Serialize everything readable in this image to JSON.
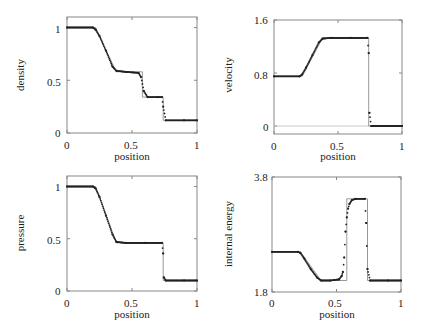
{
  "chart_data": [
    {
      "type": "line",
      "title": "",
      "xlabel": "position",
      "ylabel": "density",
      "xlim": [
        0,
        1
      ],
      "ylim": [
        0,
        1.1
      ],
      "xticks": [
        "0",
        "0.5",
        "1"
      ],
      "yticks": [
        "0",
        "0.5",
        "1"
      ],
      "grid": false,
      "series": [
        {
          "name": "exact",
          "style": "thin gray line",
          "x": [
            0,
            0.22,
            0.3,
            0.38,
            0.58,
            0.58,
            0.74,
            0.74,
            1.0
          ],
          "y": [
            1.0,
            1.0,
            0.78,
            0.58,
            0.58,
            0.34,
            0.34,
            0.12,
            0.12
          ]
        },
        {
          "name": "numerical",
          "style": "dots",
          "x": [
            0,
            0.2,
            0.22,
            0.25,
            0.3,
            0.35,
            0.38,
            0.45,
            0.55,
            0.57,
            0.59,
            0.62,
            0.7,
            0.73,
            0.74,
            0.76,
            0.9,
            1.0
          ],
          "y": [
            1.0,
            1.0,
            0.98,
            0.92,
            0.78,
            0.63,
            0.59,
            0.58,
            0.57,
            0.53,
            0.4,
            0.34,
            0.34,
            0.34,
            0.25,
            0.12,
            0.12,
            0.12
          ]
        }
      ]
    },
    {
      "type": "line",
      "title": "",
      "xlabel": "position",
      "ylabel": "velocity",
      "xlim": [
        0,
        1
      ],
      "ylim": [
        -0.12,
        1.6
      ],
      "xticks": [
        "0",
        "0.5",
        "1"
      ],
      "yticks": [
        "0",
        "0.8",
        "1.6"
      ],
      "grid": false,
      "series": [
        {
          "name": "exact",
          "style": "thin gray line",
          "x": [
            0,
            0.22,
            0.38,
            0.74,
            0.74,
            1.0
          ],
          "y": [
            0.75,
            0.75,
            1.33,
            1.33,
            0.0,
            0.0
          ]
        },
        {
          "name": "numerical",
          "style": "dots",
          "x": [
            0,
            0.2,
            0.22,
            0.25,
            0.3,
            0.35,
            0.38,
            0.45,
            0.6,
            0.73,
            0.74,
            0.745,
            0.76,
            0.9,
            1.0
          ],
          "y": [
            0.75,
            0.75,
            0.78,
            0.88,
            1.07,
            1.26,
            1.32,
            1.33,
            1.33,
            1.33,
            1.1,
            0.2,
            0.0,
            0.0,
            0.0
          ]
        }
      ]
    },
    {
      "type": "line",
      "title": "",
      "xlabel": "position",
      "ylabel": "pressure",
      "xlim": [
        0,
        1
      ],
      "ylim": [
        0,
        1.1
      ],
      "xticks": [
        "0",
        "0.5",
        "1"
      ],
      "yticks": [
        "0",
        "0.5",
        "1"
      ],
      "grid": false,
      "series": [
        {
          "name": "exact",
          "style": "thin gray line",
          "x": [
            0,
            0.22,
            0.38,
            0.74,
            0.74,
            1.0
          ],
          "y": [
            1.0,
            1.0,
            0.46,
            0.46,
            0.1,
            0.1
          ]
        },
        {
          "name": "numerical",
          "style": "dots",
          "x": [
            0,
            0.2,
            0.22,
            0.25,
            0.3,
            0.35,
            0.38,
            0.45,
            0.6,
            0.73,
            0.74,
            0.745,
            0.76,
            0.9,
            1.0
          ],
          "y": [
            1.0,
            1.0,
            0.98,
            0.9,
            0.72,
            0.54,
            0.47,
            0.46,
            0.46,
            0.46,
            0.36,
            0.13,
            0.1,
            0.1,
            0.1
          ]
        }
      ]
    },
    {
      "type": "line",
      "title": "",
      "xlabel": "position",
      "ylabel": "internal energy",
      "xlim": [
        0,
        1
      ],
      "ylim": [
        1.8,
        3.8
      ],
      "xticks": [
        "0",
        "0.5",
        "1"
      ],
      "yticks": [
        "1.8",
        "3.8"
      ],
      "grid": false,
      "series": [
        {
          "name": "exact",
          "style": "thin gray line",
          "x": [
            0,
            0.22,
            0.38,
            0.58,
            0.58,
            0.74,
            0.74,
            1.0
          ],
          "y": [
            2.5,
            2.5,
            2.0,
            2.0,
            3.42,
            3.42,
            2.0,
            2.0
          ]
        },
        {
          "name": "numerical",
          "style": "dots",
          "x": [
            0,
            0.2,
            0.22,
            0.25,
            0.3,
            0.35,
            0.38,
            0.45,
            0.52,
            0.54,
            0.55,
            0.56,
            0.57,
            0.58,
            0.59,
            0.6,
            0.62,
            0.65,
            0.72,
            0.73,
            0.74,
            0.76,
            0.9,
            1.0
          ],
          "y": [
            2.5,
            2.5,
            2.48,
            2.38,
            2.2,
            2.05,
            2.0,
            2.0,
            2.02,
            2.08,
            2.15,
            2.4,
            2.85,
            3.1,
            3.25,
            3.33,
            3.4,
            3.42,
            3.42,
            3.0,
            2.2,
            2.0,
            2.0,
            2.0
          ]
        }
      ]
    }
  ],
  "panels": [
    {
      "ylabel": "density",
      "xlabel": "position",
      "xticks": [
        "0",
        "0.5",
        "1"
      ],
      "yticks": [
        "0",
        "0.5",
        "1"
      ]
    },
    {
      "ylabel": "velocity",
      "xlabel": "position",
      "xticks": [
        "0",
        "0.5",
        "1"
      ],
      "yticks": [
        "0",
        "0.8",
        "1.6"
      ]
    },
    {
      "ylabel": "pressure",
      "xlabel": "position",
      "xticks": [
        "0",
        "0.5",
        "1"
      ],
      "yticks": [
        "0",
        "0.5",
        "1"
      ]
    },
    {
      "ylabel": "internal energy",
      "xlabel": "position",
      "xticks": [
        "0",
        "0.5",
        "1"
      ],
      "yticks": [
        "1.8",
        "3.8"
      ]
    }
  ],
  "colors": {
    "frame": "#888888",
    "exact_line": "#999999",
    "dots": "#222222"
  }
}
